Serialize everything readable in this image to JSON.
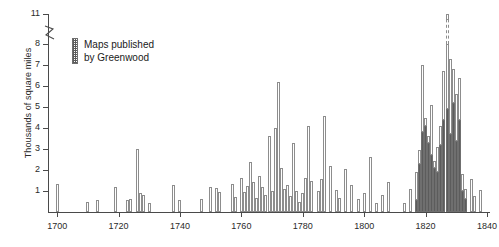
{
  "chart_data": {
    "type": "bar",
    "title": "",
    "xlabel": "",
    "ylabel": "Thousands of square miles",
    "xlim": [
      1697,
      1841
    ],
    "ylim": [
      0,
      11
    ],
    "grid": false,
    "axis_break": {
      "present": true,
      "between": [
        8,
        11
      ],
      "note": "y-axis broken between 8 and 11"
    },
    "ytick_labels": [
      "1",
      "2",
      "3",
      "4",
      "5",
      "6",
      "7",
      "8",
      "11"
    ],
    "ytick_values": [
      1,
      2,
      3,
      4,
      5,
      6,
      7,
      8,
      11
    ],
    "xtick_labels": [
      "1700",
      "1720",
      "1740",
      "1760",
      "1780",
      "1800",
      "1820",
      "1840"
    ],
    "xtick_values": [
      1700,
      1720,
      1740,
      1760,
      1780,
      1800,
      1820,
      1840
    ],
    "legend": {
      "position": "top-left-inside",
      "entries": [
        {
          "label": "Maps published by Greenwood",
          "pattern": "hatched",
          "color": "#5c5c5c"
        }
      ]
    },
    "series": [
      {
        "name": "Other county maps",
        "pattern": "open",
        "color": "#ffffff"
      },
      {
        "name": "Maps published by Greenwood",
        "pattern": "hatched",
        "color": "#5c5c5c"
      }
    ],
    "note": "Stacked bars: hatched (Greenwood) portion at base, open portion above. Tallest bar (1827) is broken and reaches 11.",
    "points": [
      {
        "x": 1700,
        "other": 1.35,
        "greenwood": 0
      },
      {
        "x": 1710,
        "other": 0.5,
        "greenwood": 0
      },
      {
        "x": 1713,
        "other": 0.55,
        "greenwood": 0
      },
      {
        "x": 1719,
        "other": 1.2,
        "greenwood": 0
      },
      {
        "x": 1723,
        "other": 0.55,
        "greenwood": 0
      },
      {
        "x": 1724,
        "other": 0.6,
        "greenwood": 0
      },
      {
        "x": 1726,
        "other": 3.0,
        "greenwood": 0
      },
      {
        "x": 1727,
        "other": 0.9,
        "greenwood": 0
      },
      {
        "x": 1728,
        "other": 0.8,
        "greenwood": 0
      },
      {
        "x": 1730,
        "other": 0.45,
        "greenwood": 0
      },
      {
        "x": 1738,
        "other": 1.3,
        "greenwood": 0
      },
      {
        "x": 1740,
        "other": 0.55,
        "greenwood": 0
      },
      {
        "x": 1747,
        "other": 0.6,
        "greenwood": 0
      },
      {
        "x": 1750,
        "other": 1.2,
        "greenwood": 0
      },
      {
        "x": 1752,
        "other": 1.15,
        "greenwood": 0
      },
      {
        "x": 1753,
        "other": 0.95,
        "greenwood": 0
      },
      {
        "x": 1757,
        "other": 1.35,
        "greenwood": 0
      },
      {
        "x": 1758,
        "other": 0.7,
        "greenwood": 0
      },
      {
        "x": 1760,
        "other": 1.6,
        "greenwood": 0
      },
      {
        "x": 1761,
        "other": 0.95,
        "greenwood": 0
      },
      {
        "x": 1762,
        "other": 1.25,
        "greenwood": 0
      },
      {
        "x": 1763,
        "other": 2.4,
        "greenwood": 0
      },
      {
        "x": 1764,
        "other": 1.45,
        "greenwood": 0
      },
      {
        "x": 1765,
        "other": 0.65,
        "greenwood": 0
      },
      {
        "x": 1766,
        "other": 1.7,
        "greenwood": 0
      },
      {
        "x": 1767,
        "other": 1.2,
        "greenwood": 0
      },
      {
        "x": 1768,
        "other": 0.8,
        "greenwood": 0
      },
      {
        "x": 1769,
        "other": 3.6,
        "greenwood": 0
      },
      {
        "x": 1770,
        "other": 1.0,
        "greenwood": 0
      },
      {
        "x": 1771,
        "other": 4.0,
        "greenwood": 0
      },
      {
        "x": 1772,
        "other": 6.2,
        "greenwood": 0
      },
      {
        "x": 1773,
        "other": 2.1,
        "greenwood": 0
      },
      {
        "x": 1774,
        "other": 1.1,
        "greenwood": 0
      },
      {
        "x": 1775,
        "other": 1.3,
        "greenwood": 0
      },
      {
        "x": 1776,
        "other": 0.75,
        "greenwood": 0
      },
      {
        "x": 1777,
        "other": 3.3,
        "greenwood": 0
      },
      {
        "x": 1778,
        "other": 1.0,
        "greenwood": 0
      },
      {
        "x": 1779,
        "other": 0.5,
        "greenwood": 0
      },
      {
        "x": 1780,
        "other": 0.9,
        "greenwood": 0
      },
      {
        "x": 1781,
        "other": 1.6,
        "greenwood": 0
      },
      {
        "x": 1782,
        "other": 4.1,
        "greenwood": 0
      },
      {
        "x": 1783,
        "other": 1.5,
        "greenwood": 0
      },
      {
        "x": 1785,
        "other": 1.0,
        "greenwood": 0
      },
      {
        "x": 1786,
        "other": 1.55,
        "greenwood": 0
      },
      {
        "x": 1787,
        "other": 4.55,
        "greenwood": 0
      },
      {
        "x": 1789,
        "other": 2.2,
        "greenwood": 0
      },
      {
        "x": 1791,
        "other": 1.05,
        "greenwood": 0
      },
      {
        "x": 1792,
        "other": 0.65,
        "greenwood": 0
      },
      {
        "x": 1794,
        "other": 2.05,
        "greenwood": 0
      },
      {
        "x": 1796,
        "other": 1.3,
        "greenwood": 0
      },
      {
        "x": 1798,
        "other": 0.6,
        "greenwood": 0
      },
      {
        "x": 1800,
        "other": 0.9,
        "greenwood": 0
      },
      {
        "x": 1802,
        "other": 2.6,
        "greenwood": 0
      },
      {
        "x": 1804,
        "other": 0.45,
        "greenwood": 0
      },
      {
        "x": 1806,
        "other": 0.8,
        "greenwood": 0
      },
      {
        "x": 1808,
        "other": 1.45,
        "greenwood": 0
      },
      {
        "x": 1813,
        "other": 0.45,
        "greenwood": 0
      },
      {
        "x": 1815,
        "other": 1.1,
        "greenwood": 0
      },
      {
        "x": 1817,
        "other": 1.35,
        "greenwood": 0.55
      },
      {
        "x": 1818,
        "other": 0.65,
        "greenwood": 2.3
      },
      {
        "x": 1819,
        "other": 3.2,
        "greenwood": 3.8
      },
      {
        "x": 1820,
        "other": 0.4,
        "greenwood": 4.1
      },
      {
        "x": 1821,
        "other": 0.3,
        "greenwood": 3.3
      },
      {
        "x": 1822,
        "other": 2.4,
        "greenwood": 2.7
      },
      {
        "x": 1823,
        "other": 0.35,
        "greenwood": 2.1
      },
      {
        "x": 1824,
        "other": 1.2,
        "greenwood": 1.9
      },
      {
        "x": 1825,
        "other": 0.9,
        "greenwood": 3.2
      },
      {
        "x": 1826,
        "other": 2.3,
        "greenwood": 4.4
      },
      {
        "x": 1827,
        "other": 6.1,
        "greenwood": 4.9
      },
      {
        "x": 1828,
        "other": 3.6,
        "greenwood": 3.7
      },
      {
        "x": 1829,
        "other": 1.6,
        "greenwood": 5.2
      },
      {
        "x": 1830,
        "other": 2.2,
        "greenwood": 3.4
      },
      {
        "x": 1831,
        "other": 2.0,
        "greenwood": 4.4
      },
      {
        "x": 1832,
        "other": 0.8,
        "greenwood": 1.0
      },
      {
        "x": 1833,
        "other": 0.5,
        "greenwood": 0.6
      },
      {
        "x": 1835,
        "other": 1.55,
        "greenwood": 0
      },
      {
        "x": 1836,
        "other": 0.75,
        "greenwood": 0
      },
      {
        "x": 1838,
        "other": 1.05,
        "greenwood": 0
      }
    ]
  }
}
